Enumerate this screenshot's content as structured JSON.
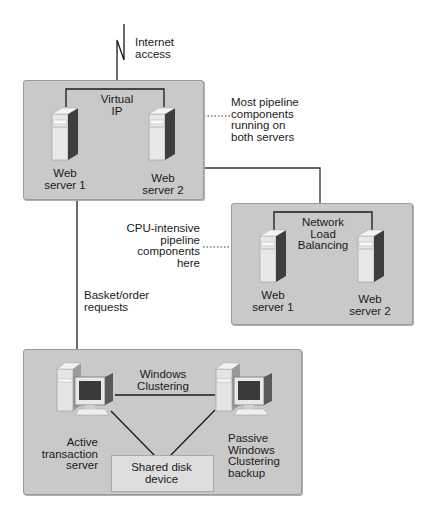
{
  "diagram": {
    "internet": {
      "label": "Internet\naccess"
    },
    "web_farm": {
      "bracket_label": "Virtual\nIP",
      "servers": [
        {
          "label": "Web\nserver 1"
        },
        {
          "label": "Web\nserver 2"
        }
      ],
      "annotation": "Most pipeline\ncomponents\nrunning on\nboth servers"
    },
    "nlb_farm": {
      "bracket_label": "Network\nLoad\nBalancing",
      "servers": [
        {
          "label": "Web\nserver 1"
        },
        {
          "label": "Web\nserver 2"
        }
      ],
      "annotation": "CPU-intensive\npipeline\ncomponents\nhere"
    },
    "request_flow": {
      "label": "Basket/order\nrequests"
    },
    "cluster": {
      "link_label": "Windows\nClustering",
      "active": {
        "label": "Active\ntransaction\nserver"
      },
      "passive": {
        "label": "Passive\nWindows\nClustering\nbackup"
      },
      "shared_disk": {
        "label": "Shared disk\ndevice"
      }
    },
    "colors": {
      "box_fill": "#c9c9c9",
      "box_border": "#9a9a9a",
      "line": "#1a1a1a",
      "disk_fill": "#dedede"
    }
  }
}
